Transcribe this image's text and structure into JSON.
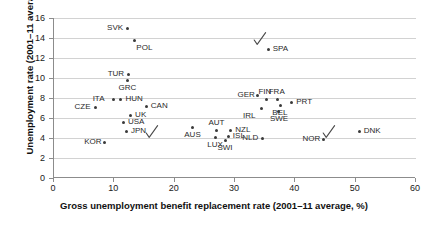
{
  "chart_data": {
    "type": "scatter",
    "title": "",
    "xlabel": "Gross unemployment benefit replacement rate (2001–11 average, %)",
    "ylabel": "Unemployment rate (2001–11 average, %)",
    "xlim": [
      0,
      60
    ],
    "ylim": [
      0,
      16
    ],
    "xticks": [
      0,
      10,
      20,
      30,
      40,
      50,
      60
    ],
    "yticks": [
      0,
      2,
      4,
      6,
      8,
      10,
      12,
      14,
      16
    ],
    "grid": "horizontal",
    "legend": "none",
    "points": [
      {
        "label": "SVK",
        "x": 12.2,
        "y": 15.0,
        "label_pos": "left"
      },
      {
        "label": "POL",
        "x": 13.4,
        "y": 13.8,
        "label_pos": "below-right"
      },
      {
        "label": "TUR",
        "x": 12.3,
        "y": 10.4,
        "label_pos": "left"
      },
      {
        "label": "GRC",
        "x": 12.1,
        "y": 9.8,
        "label_pos": "below"
      },
      {
        "label": "GER",
        "x": 33.8,
        "y": 8.3,
        "label_pos": "left"
      },
      {
        "label": "ITA",
        "x": 9.8,
        "y": 7.9,
        "label_pos": "left"
      },
      {
        "label": "HUN",
        "x": 11.1,
        "y": 7.9,
        "label_pos": "right"
      },
      {
        "label": "CAN",
        "x": 15.3,
        "y": 7.2,
        "label_pos": "right"
      },
      {
        "label": "CZE",
        "x": 6.8,
        "y": 7.1,
        "label_pos": "left"
      },
      {
        "label": "FIN",
        "x": 35.3,
        "y": 7.9,
        "label_pos": "above"
      },
      {
        "label": "FRA",
        "x": 37.0,
        "y": 7.9,
        "label_pos": "above"
      },
      {
        "label": "PRT",
        "x": 39.4,
        "y": 7.6,
        "label_pos": "right"
      },
      {
        "label": "BEL",
        "x": 37.6,
        "y": 7.3,
        "label_pos": "below"
      },
      {
        "label": "IRL",
        "x": 34.4,
        "y": 7.0,
        "label_pos": "below-left"
      },
      {
        "label": "SWE",
        "x": 37.2,
        "y": 6.7,
        "label_pos": "below"
      },
      {
        "label": "UK",
        "x": 12.7,
        "y": 6.3,
        "label_pos": "right"
      },
      {
        "label": "USA",
        "x": 11.5,
        "y": 5.6,
        "label_pos": "right"
      },
      {
        "label": "SPA",
        "x": 35.5,
        "y": 12.9,
        "label_pos": "right"
      },
      {
        "label": "JPN",
        "x": 12.0,
        "y": 4.7,
        "label_pos": "right"
      },
      {
        "label": "AUS",
        "x": 23.0,
        "y": 5.1,
        "label_pos": "below"
      },
      {
        "label": "AUT",
        "x": 27.0,
        "y": 4.8,
        "label_pos": "above"
      },
      {
        "label": "NZL",
        "x": 29.3,
        "y": 4.8,
        "label_pos": "right"
      },
      {
        "label": "LUX",
        "x": 26.8,
        "y": 4.1,
        "label_pos": "below"
      },
      {
        "label": "ISL",
        "x": 28.9,
        "y": 4.2,
        "label_pos": "right"
      },
      {
        "label": "SWI",
        "x": 28.5,
        "y": 3.8,
        "label_pos": "below"
      },
      {
        "label": "NLD",
        "x": 34.6,
        "y": 4.0,
        "label_pos": "left"
      },
      {
        "label": "NOR",
        "x": 44.6,
        "y": 3.9,
        "label_pos": "left"
      },
      {
        "label": "DNK",
        "x": 50.6,
        "y": 4.7,
        "label_pos": "right"
      },
      {
        "label": "KOR",
        "x": 8.4,
        "y": 3.6,
        "label_pos": "left"
      }
    ],
    "annotations": [
      {
        "kind": "check-mark",
        "x": 16.2,
        "y": 4.6
      },
      {
        "kind": "check-mark",
        "x": 34.2,
        "y": 13.9
      },
      {
        "kind": "check-mark",
        "x": 45.6,
        "y": 4.6
      }
    ]
  }
}
